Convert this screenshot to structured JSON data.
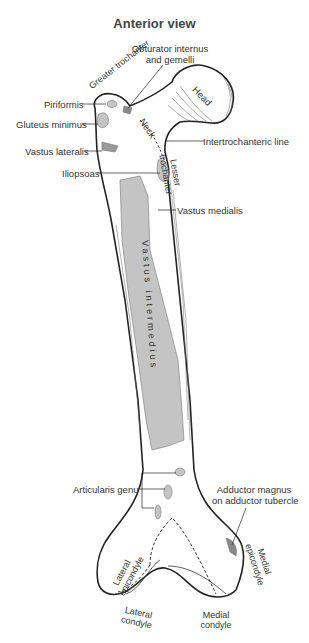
{
  "figure": {
    "title": "Anterior view",
    "colors": {
      "bone_outline": "#222222",
      "muscle_attachment": "#c4c4c4",
      "background": "#ffffff",
      "label_text": "#333333"
    },
    "labels": {
      "obturator": [
        "Obturator internus",
        "and gemelli"
      ],
      "greater_trochanter": "Greater trochanter",
      "head": "Head",
      "neck": "Neck",
      "piriformis": "Piriformis",
      "gluteus_minimus": "Gluteus minimus",
      "vastus_lateralis": "Vastus lateralis",
      "intertrochanteric_line": "Intertrochanteric line",
      "lesser_trochanter": "Lesser trochanter",
      "iliopsoas": "Iliopsoas",
      "vastus_medialis": "Vastus medialis",
      "vastus_intermedius": "Vastus intermedius",
      "articularis_genu": "Articularis genu",
      "adductor_magnus": [
        "Adductor magnus",
        "on adductor tubercle"
      ],
      "lateral_epicondyle": "Lateral epicondyle",
      "medial_epicondyle": "Medial epicondyle",
      "lateral_condyle": "Lateral condyle",
      "medial_condyle": "Medial condyle"
    }
  }
}
